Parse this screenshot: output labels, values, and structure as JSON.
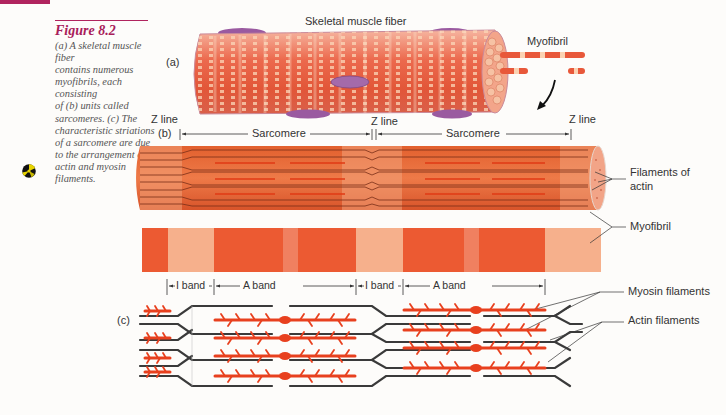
{
  "figure": {
    "number": "Figure 8.2",
    "caption_lines": [
      "(a) A skeletal muscle fiber",
      "contains numerous",
      "myofibrils, each consisting",
      "of (b) units called",
      "sarcomeres. (c) The",
      "characteristic striations",
      "of a sarcomere are due",
      "to the arrangement of",
      "actin and myosin",
      "filaments."
    ],
    "media_icon": "cd-rom-icon"
  },
  "panel_a": {
    "marker": "(a)",
    "title": "Skeletal muscle fiber",
    "myofibril_label": "Myofibril"
  },
  "panel_b": {
    "marker": "(b)",
    "z_lines": [
      "Z line",
      "Z line",
      "Z line"
    ],
    "sarcomere_labels": [
      "Sarcomere",
      "Sarcomere"
    ],
    "filaments_label_line1": "Filaments of",
    "filaments_label_line2": "actin",
    "myofibril_label": "Myofibril"
  },
  "panel_c": {
    "marker": "(c)",
    "bands": [
      "I band",
      "A band",
      "I band",
      "A band"
    ],
    "myosin_label": "Myosin filaments",
    "actin_label": "Actin filaments"
  },
  "colors": {
    "accent": "#b0245e",
    "muscle_red": "#e8532e",
    "muscle_light": "#f4b08e",
    "sarcolemma_purple": "#9a5aa0",
    "filament_dark": "#3a3a3a",
    "myosin_red": "#e8401e"
  }
}
